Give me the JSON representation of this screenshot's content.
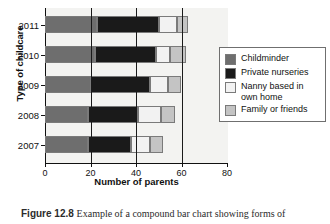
{
  "chart_data": {
    "type": "bar",
    "orientation": "horizontal",
    "stacked": true,
    "title": "",
    "xlabel": "Number of parents",
    "ylabel": "Type of childcare",
    "categories": [
      "2011",
      "2010",
      "2009",
      "2008",
      "2007"
    ],
    "xlim": [
      0,
      80
    ],
    "xticks": [
      0,
      20,
      40,
      60,
      80
    ],
    "xtick_labels": [
      "0",
      "20",
      "40",
      "60",
      "80"
    ],
    "grid": "vertical gridlines at 20, 40, 60",
    "legend_position": "right",
    "series": [
      {
        "name": "Childminder",
        "color": "#6e6e6e",
        "values": [
          23,
          22,
          20,
          19,
          19
        ]
      },
      {
        "name": "Private nurseries",
        "color": "#1a1a1a",
        "values": [
          27,
          27,
          26,
          22,
          19
        ]
      },
      {
        "name": "Nanny based in own home",
        "color": "#f2f2f2",
        "values": [
          8,
          6,
          8,
          10,
          8
        ]
      },
      {
        "name": "Family or friends",
        "color": "#c4c4c4",
        "values": [
          5,
          7,
          6,
          6,
          6
        ]
      }
    ],
    "cumulative_ends": {
      "2011": [
        23,
        50,
        58,
        63
      ],
      "2010": [
        22,
        49,
        55,
        62
      ],
      "2009": [
        20,
        46,
        54,
        60
      ],
      "2008": [
        19,
        41,
        51,
        57
      ],
      "2007": [
        19,
        38,
        46,
        52
      ]
    }
  },
  "axes": {
    "x_title": "Number of parents",
    "y_title": "Type of childcare",
    "x_tick_labels": [
      "0",
      "20",
      "40",
      "60",
      "80"
    ],
    "y_tick_labels": [
      "2011",
      "2010",
      "2009",
      "2008",
      "2007"
    ]
  },
  "legend": {
    "items": [
      {
        "label": "Childminder",
        "color": "#6e6e6e"
      },
      {
        "label": "Private nurseries",
        "color": "#1a1a1a"
      },
      {
        "label": "Nanny based in\nown home",
        "color": "#f2f2f2"
      },
      {
        "label": "Family or friends",
        "color": "#c4c4c4"
      }
    ],
    "item_labels": [
      "Childminder",
      "Private nurseries",
      "Nanny based in own home",
      "Family or friends"
    ]
  },
  "caption": {
    "number": "Figure 12.8",
    "text": "Example of a compound bar chart showing forms of"
  }
}
